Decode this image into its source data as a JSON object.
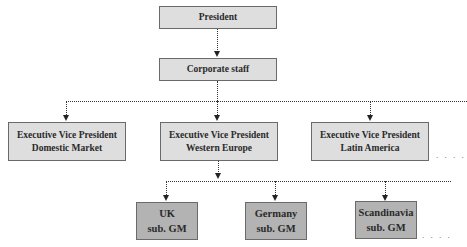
{
  "diagram": {
    "type": "org-chart",
    "top": {
      "label": "President"
    },
    "staff": {
      "label": "Corporate staff"
    },
    "divisions": [
      {
        "line1": "Executive Vice President",
        "line2": "Domestic Market"
      },
      {
        "line1": "Executive Vice President",
        "line2": "Western Europe"
      },
      {
        "line1": "Executive Vice President",
        "line2": "Latin America"
      }
    ],
    "subsidiaries": [
      {
        "line1": "UK",
        "line2": "sub. GM"
      },
      {
        "line1": "Germany",
        "line2": "sub. GM"
      },
      {
        "line1": "Scandinavia",
        "line2": "sub. GM"
      }
    ],
    "continuation": ". . . .",
    "colors": {
      "light_box": "#dedede",
      "dark_box": "#b3b3b3",
      "border": "#6a6a6a"
    }
  }
}
